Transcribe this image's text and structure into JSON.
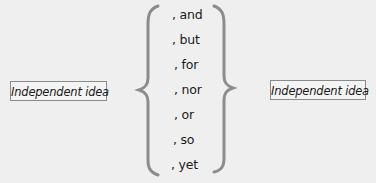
{
  "diagram": {
    "left_box": {
      "label": "Independent idea"
    },
    "right_box": {
      "label": "Independent idea"
    },
    "conjunctions": [
      ", and",
      ", but",
      ", for",
      ", nor",
      ", or",
      ", so",
      ", yet"
    ],
    "colors": {
      "background": "#efefef",
      "brace": "#8c8c8c",
      "box_border": "#8a8a8a",
      "text": "#1a1a1a"
    }
  }
}
